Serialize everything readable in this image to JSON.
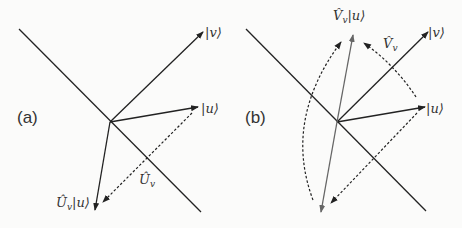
{
  "panels": [
    {
      "id": "a",
      "label": "(a)",
      "vectors": {
        "v": "|v⟩",
        "u": "|u⟩",
        "result": "Û_v|u⟩",
        "operator": "Û_v"
      },
      "labels": {
        "v": "|v⟩",
        "u": "|u⟩",
        "result_hat": "Û",
        "result_sub": "v",
        "result_ket": "|u⟩",
        "op_hat": "Û",
        "op_sub": "v"
      }
    },
    {
      "id": "b",
      "label": "(b)",
      "labels": {
        "v": "|v⟩",
        "u": "|u⟩",
        "result_hat": "V̂",
        "result_sub": "v",
        "result_ket": "|u⟩",
        "op_hat": "V̂",
        "op_sub": "v"
      }
    }
  ],
  "colors": {
    "line": "#222222",
    "text": "#333333",
    "result_vector_b": "#666666"
  }
}
